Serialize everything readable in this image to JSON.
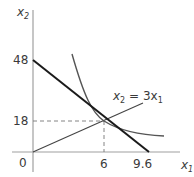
{
  "diagram": {
    "type": "consumer-choice",
    "axes": {
      "y_label": "x",
      "y_label_sub": "2",
      "x_label": "x",
      "x_label_sub": "1",
      "origin_label": "0"
    },
    "ticks": {
      "y": [
        "48",
        "18"
      ],
      "x": [
        "6",
        "9.6"
      ]
    },
    "ray": {
      "label_lhs": "x",
      "label_lhs_sub": "2",
      "label_eq": " = 3x",
      "label_rhs_sub": "1"
    },
    "budget_line": {
      "x_intercept": 9.6,
      "y_intercept": 48
    },
    "optimum": {
      "x": 6,
      "y": 18
    },
    "colors": {
      "axis": "#a0a0a0",
      "budget_line": "#1a1a1a",
      "indifference_curve": "#555555",
      "ray": "#444444",
      "guide": "#777777",
      "text": "#3a3a3a"
    }
  }
}
